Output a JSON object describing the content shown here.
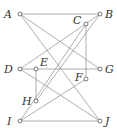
{
  "diagram": {
    "type": "graph",
    "nodes": [
      {
        "id": "A",
        "label": "A",
        "x": 20,
        "y": 14,
        "lx": 4,
        "ly": 18
      },
      {
        "id": "B",
        "label": "B",
        "x": 100,
        "y": 14,
        "lx": 105,
        "ly": 18
      },
      {
        "id": "C",
        "label": "C",
        "x": 86,
        "y": 24,
        "lx": 73,
        "ly": 24
      },
      {
        "id": "D",
        "label": "D",
        "x": 20,
        "y": 69,
        "lx": 4,
        "ly": 73
      },
      {
        "id": "E",
        "label": "E",
        "x": 36,
        "y": 69,
        "lx": 40,
        "ly": 66
      },
      {
        "id": "F",
        "label": "F",
        "x": 86,
        "y": 79,
        "lx": 75,
        "ly": 81
      },
      {
        "id": "G",
        "label": "G",
        "x": 100,
        "y": 69,
        "lx": 105,
        "ly": 73
      },
      {
        "id": "H",
        "label": "H",
        "x": 36,
        "y": 101,
        "lx": 22,
        "ly": 105
      },
      {
        "id": "I",
        "label": "I",
        "x": 20,
        "y": 121,
        "lx": 7,
        "ly": 125
      },
      {
        "id": "J",
        "label": "J",
        "x": 100,
        "y": 121,
        "lx": 105,
        "ly": 125
      }
    ],
    "edges": [
      [
        "A",
        "B"
      ],
      [
        "A",
        "G"
      ],
      [
        "A",
        "J"
      ],
      [
        "B",
        "D"
      ],
      [
        "B",
        "H"
      ],
      [
        "C",
        "F"
      ],
      [
        "C",
        "I"
      ],
      [
        "D",
        "G"
      ],
      [
        "D",
        "J"
      ],
      [
        "E",
        "H"
      ],
      [
        "F",
        "I"
      ],
      [
        "I",
        "J"
      ]
    ],
    "colors": {
      "edge": "#9a9a9a",
      "node_stroke": "#555555",
      "label": "#333333"
    }
  }
}
